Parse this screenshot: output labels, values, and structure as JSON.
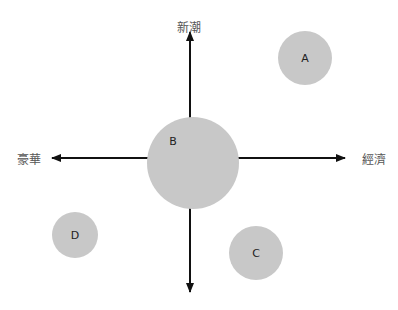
{
  "axes": {
    "top": "新潮",
    "left": "豪華",
    "right": "經濟"
  },
  "colors": {
    "bubble": "#c8c8c8",
    "axis": "#111111"
  },
  "bubbles": [
    {
      "label": "A",
      "cx": 305,
      "cy": 58,
      "r": 27
    },
    {
      "label": "B",
      "cx": 193,
      "cy": 163,
      "r": 46
    },
    {
      "label": "C",
      "cx": 256,
      "cy": 253,
      "r": 27
    },
    {
      "label": "D",
      "cx": 75,
      "cy": 235,
      "r": 23
    }
  ]
}
